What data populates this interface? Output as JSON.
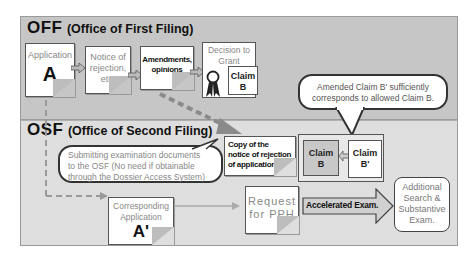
{
  "off": {
    "title_abbr": "OFF",
    "title_full": "(Office of First Filing)",
    "application": {
      "label": "Application",
      "letter": "A"
    },
    "notice": {
      "line1": "Notice of",
      "line2": "rejection,",
      "line3": "etc."
    },
    "amendments": {
      "line1": "Amendments,",
      "line2": "opinions"
    },
    "decision": {
      "line1": "Decision to",
      "line2": "Grant"
    },
    "claim": {
      "line1": "Claim",
      "line2": "B"
    }
  },
  "callout_top": {
    "line1": "Amended Claim B' sufficiently",
    "line2": "corresponds to allowed Claim B."
  },
  "osf": {
    "title_abbr": "OSF",
    "title_full": "(Office of Second Filing)",
    "submit_callout": {
      "line1": "Submitting examination documents",
      "line2": "to the OSF (No need if obtainable",
      "line3": "through the Dossier Access System)"
    },
    "copy_notice": {
      "line1": "Copy of the",
      "line2": "notice of rejection",
      "line3": "of application A"
    },
    "claim_b": {
      "line1": "Claim",
      "line2": "B"
    },
    "claim_b_prime": {
      "line1": "Claim",
      "line2": "B'"
    },
    "corresponding": {
      "line1": "Corresponding",
      "line2": "Application",
      "letter": "A'"
    },
    "request_pph": {
      "line1": "Request",
      "line2": "for PPH"
    },
    "accelerated": {
      "label": "Accelerated Exam."
    },
    "additional": {
      "line1": "Additional",
      "line2": "Search &",
      "line3": "Substantive",
      "line4": "Exam."
    }
  },
  "colors": {
    "off_bg": "#c6c6c6",
    "osf_bg": "#dedede",
    "border": "#555555",
    "dashed_arrow": "#8a8a8a"
  }
}
